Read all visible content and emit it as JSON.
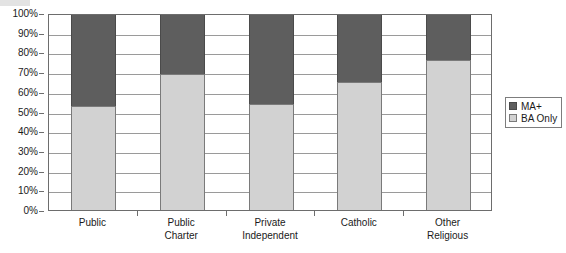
{
  "chart_data": {
    "type": "bar",
    "subtype": "stacked-100-percent",
    "title": "",
    "xlabel": "",
    "ylabel": "",
    "ylim": [
      0,
      100
    ],
    "ytick_labels": [
      "100%",
      "90%",
      "80%",
      "70%",
      "60%",
      "50%",
      "40%",
      "30%",
      "20%",
      "10%",
      "0%"
    ],
    "ytick_values": [
      100,
      90,
      80,
      70,
      60,
      50,
      40,
      30,
      20,
      10,
      0
    ],
    "grid": true,
    "legend_position": "right",
    "categories": [
      "Public",
      "Public Charter",
      "Private Independent",
      "Catholic",
      "Other Religious"
    ],
    "category_lines": [
      [
        "Public",
        ""
      ],
      [
        "Public",
        "Charter"
      ],
      [
        "Private",
        "Independent"
      ],
      [
        "Catholic",
        ""
      ],
      [
        "Other",
        "Religious"
      ]
    ],
    "series": [
      {
        "name": "BA Only",
        "color": "#d2d2d2",
        "values": [
          53,
          69,
          54,
          65,
          76
        ]
      },
      {
        "name": "MA+",
        "color": "#5e5e5e",
        "values": [
          47,
          31,
          46,
          35,
          24
        ]
      }
    ],
    "legend_order": [
      "MA+",
      "BA Only"
    ]
  },
  "legend": {
    "items": [
      {
        "label": "MA+",
        "swatch": "dark-gray-swatch"
      },
      {
        "label": "BA Only",
        "swatch": "light-gray-swatch"
      }
    ]
  }
}
